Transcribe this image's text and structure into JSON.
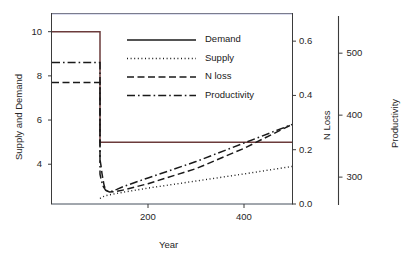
{
  "chart_data": {
    "type": "line",
    "title": "",
    "xlabel": "Year",
    "ylabel": "Supply and Demand",
    "y2label": "N Loss",
    "y3label": "Productivity",
    "xlim": [
      0,
      500
    ],
    "ylim": [
      2.2,
      10.8
    ],
    "y2lim": [
      0.0,
      0.7
    ],
    "y3lim": [
      255,
      560
    ],
    "grid": false,
    "legend_position": "top-center",
    "xticks": [
      200,
      400
    ],
    "xticklabels": [
      "200",
      "400"
    ],
    "yticks": [
      4,
      6,
      8,
      10
    ],
    "yticklabels": [
      "4",
      "6",
      "8",
      "10"
    ],
    "y2ticks": [
      0.0,
      0.2,
      0.4,
      0.6
    ],
    "y2ticklabels": [
      "0.0",
      "0.2",
      "0.4",
      "0.6"
    ],
    "y3ticks": [
      300,
      400,
      500
    ],
    "y3ticklabels": [
      "300",
      "400",
      "500"
    ],
    "series": [
      {
        "name": "Demand",
        "style": "solid",
        "axis": "left",
        "x": [
          0,
          100,
          100,
          500
        ],
        "values": [
          10.0,
          10.0,
          5.0,
          5.0
        ]
      },
      {
        "name": "Supply",
        "style": "dotted",
        "axis": "left",
        "x": [
          100,
          105,
          112,
          125,
          150,
          200,
          250,
          300,
          350,
          400,
          450,
          500
        ],
        "values": [
          2.45,
          2.52,
          2.58,
          2.64,
          2.74,
          2.92,
          3.08,
          3.24,
          3.4,
          3.56,
          3.73,
          3.9
        ]
      },
      {
        "name": "N loss",
        "style": "dashed",
        "axis": "left",
        "x": [
          0,
          100,
          100,
          102,
          104,
          106,
          108,
          110,
          112,
          115,
          120,
          130,
          150,
          200,
          300,
          400,
          500
        ],
        "values": [
          7.7,
          7.7,
          4.2,
          3.95,
          3.6,
          3.35,
          3.1,
          2.95,
          2.85,
          2.78,
          2.74,
          2.76,
          2.84,
          3.12,
          3.8,
          4.72,
          5.8
        ]
      },
      {
        "name": "Productivity",
        "style": "dashdot",
        "axis": "left",
        "x": [
          0,
          100,
          100,
          103,
          107,
          112,
          118,
          125,
          135,
          150,
          200,
          300,
          400,
          500
        ],
        "values": [
          8.6,
          8.6,
          3.55,
          3.25,
          2.98,
          2.82,
          2.76,
          2.78,
          2.86,
          3.0,
          3.38,
          4.12,
          4.96,
          5.8
        ]
      }
    ]
  },
  "legend": {
    "items": [
      {
        "label": "Demand",
        "style": "solid"
      },
      {
        "label": "Supply",
        "style": "dotted"
      },
      {
        "label": "N loss",
        "style": "dashed"
      },
      {
        "label": "Productivity",
        "style": "dashdot"
      }
    ]
  },
  "axes": {
    "left_title": "Supply and Demand",
    "bottom_title": "Year",
    "right_title": "N Loss",
    "far_right_title": "Productivity"
  },
  "colors": {
    "line": "#1a1a1a",
    "frame": "#3b3b3b",
    "text": "#262626",
    "demand_tint": "#6b3b3b",
    "top_edge_tint": "#b9bde0",
    "background": "#ffffff"
  }
}
